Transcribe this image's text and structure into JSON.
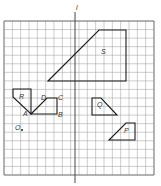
{
  "diagram": {
    "axis_label": "l",
    "grid": {
      "x0": 4,
      "y0": 21,
      "x1": 154,
      "y1": 175,
      "cols": 18,
      "rows": 18,
      "line_color": "#9a9a9a",
      "border_color": "#555555"
    },
    "axis": {
      "x": 75,
      "y_top": 12,
      "y_bottom": 183
    },
    "shapes": [
      {
        "name": "S",
        "points": "48,81 99,30 126,30 126,81",
        "label_x": 101,
        "label_y": 54
      },
      {
        "name": "R",
        "points": "13,89 31,89 31,114 13,97",
        "label_x": 19,
        "label_y": 99
      },
      {
        "name": "ABCD",
        "points": "31,114 47,98 57,98 57,114",
        "label_x": null,
        "label_y": null
      },
      {
        "name": "Q",
        "points": "92,98 101,98 117,115 92,115",
        "label_x": 97,
        "label_y": 107
      },
      {
        "name": "P",
        "points": "126,123 135,123 135,140 109,140",
        "label_x": 124,
        "label_y": 133
      }
    ],
    "vertex_labels": [
      {
        "text": "A",
        "x": 23,
        "y": 116
      },
      {
        "text": "B",
        "x": 58,
        "y": 117
      },
      {
        "text": "C",
        "x": 58,
        "y": 100
      },
      {
        "text": "D",
        "x": 41,
        "y": 100
      },
      {
        "text": "O",
        "x": 15,
        "y": 130
      }
    ],
    "point_O": {
      "x": 22,
      "y": 130
    },
    "labels": {
      "S": "S",
      "R": "R",
      "Q": "Q",
      "P": "P",
      "A": "A",
      "B": "B",
      "C": "C",
      "D": "D",
      "O": "O",
      "l": "l"
    }
  }
}
